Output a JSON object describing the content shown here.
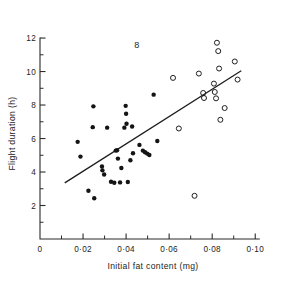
{
  "figure": {
    "number_label": "8",
    "background_color": "#ffffff",
    "ink_color": "#222222"
  },
  "chart_data": {
    "type": "scatter",
    "title": "",
    "subtitle": "",
    "xlabel": "Initial fat content (mg)",
    "ylabel": "Flight duration (h)",
    "xlim": [
      0,
      0.105
    ],
    "ylim": [
      0,
      12.6
    ],
    "grid": false,
    "legend_position": "none",
    "annotations": [
      {
        "text": "8",
        "x": 0.045,
        "y": 11.4,
        "role": "figure-number"
      }
    ],
    "x_ticks_major": [
      0,
      0.02,
      0.04,
      0.06,
      0.08,
      0.1
    ],
    "x_ticklabels": [
      "0",
      "0·02",
      "0·04",
      "0·06",
      "0·08",
      "0·10"
    ],
    "x_ticks_minor": [
      0.01,
      0.03,
      0.05,
      0.07,
      0.09
    ],
    "y_ticks_major": [
      2,
      4,
      6,
      8,
      10,
      12
    ],
    "y_ticklabels": [
      "2",
      "4",
      "6",
      "8",
      "10",
      "12"
    ],
    "y_ticks_minor": [
      1,
      3,
      5,
      7,
      9,
      11
    ],
    "series": [
      {
        "name": "filled-circles",
        "marker": "filled-circle",
        "color": "#141414",
        "points": [
          [
            0.0175,
            5.8
          ],
          [
            0.0188,
            4.92
          ],
          [
            0.0225,
            2.88
          ],
          [
            0.0245,
            6.68
          ],
          [
            0.0248,
            7.92
          ],
          [
            0.0252,
            2.43
          ],
          [
            0.0288,
            4.33
          ],
          [
            0.029,
            4.1
          ],
          [
            0.0298,
            3.85
          ],
          [
            0.0312,
            6.65
          ],
          [
            0.033,
            3.42
          ],
          [
            0.0345,
            3.36
          ],
          [
            0.0352,
            5.28
          ],
          [
            0.0358,
            5.3
          ],
          [
            0.0362,
            4.8
          ],
          [
            0.0372,
            3.38
          ],
          [
            0.0378,
            4.24
          ],
          [
            0.0392,
            6.65
          ],
          [
            0.0398,
            7.95
          ],
          [
            0.04,
            7.48
          ],
          [
            0.0402,
            6.88
          ],
          [
            0.0408,
            3.4
          ],
          [
            0.042,
            4.7
          ],
          [
            0.0428,
            6.72
          ],
          [
            0.0432,
            5.12
          ],
          [
            0.0462,
            5.62
          ],
          [
            0.0478,
            5.28
          ],
          [
            0.0488,
            5.18
          ],
          [
            0.0498,
            5.1
          ],
          [
            0.0508,
            5.02
          ],
          [
            0.0528,
            8.62
          ],
          [
            0.0545,
            5.85
          ]
        ]
      },
      {
        "name": "open-circles",
        "marker": "open-circle",
        "color": "#1f1f1f",
        "points": [
          [
            0.0618,
            9.62
          ],
          [
            0.0645,
            6.6
          ],
          [
            0.0718,
            2.58
          ],
          [
            0.0738,
            9.88
          ],
          [
            0.0758,
            8.72
          ],
          [
            0.0762,
            8.42
          ],
          [
            0.0808,
            9.28
          ],
          [
            0.0812,
            8.78
          ],
          [
            0.0818,
            8.4
          ],
          [
            0.0822,
            11.72
          ],
          [
            0.0828,
            11.22
          ],
          [
            0.0832,
            10.18
          ],
          [
            0.0838,
            7.12
          ],
          [
            0.0858,
            7.82
          ],
          [
            0.0905,
            10.6
          ],
          [
            0.0918,
            9.52
          ]
        ]
      }
    ],
    "fit_line": {
      "name": "regression-line",
      "x_start": 0.0115,
      "y_start": 3.35,
      "x_end": 0.0935,
      "y_end": 10.05
    }
  }
}
